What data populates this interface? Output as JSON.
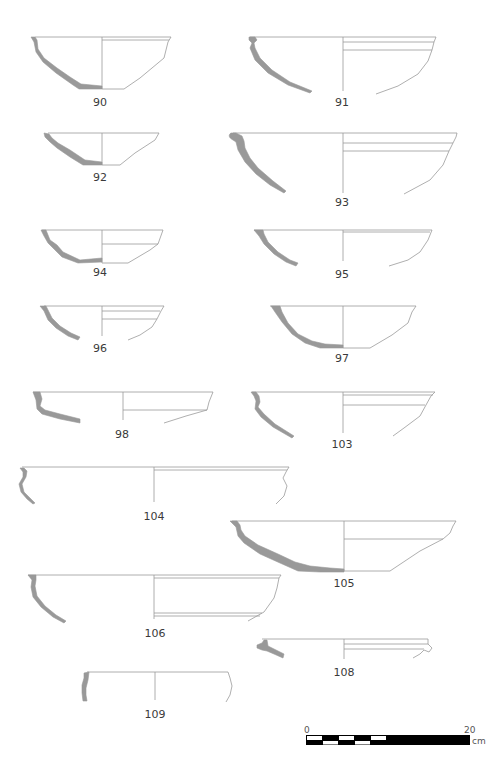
{
  "figure": {
    "type": "pottery profile drawing plate",
    "vessels": [
      {
        "id": "90",
        "label": "90"
      },
      {
        "id": "91",
        "label": "91"
      },
      {
        "id": "92",
        "label": "92"
      },
      {
        "id": "93",
        "label": "93"
      },
      {
        "id": "94",
        "label": "94"
      },
      {
        "id": "95",
        "label": "95"
      },
      {
        "id": "96",
        "label": "96"
      },
      {
        "id": "97",
        "label": "97"
      },
      {
        "id": "98",
        "label": "98"
      },
      {
        "id": "103",
        "label": "103"
      },
      {
        "id": "104",
        "label": "104"
      },
      {
        "id": "105",
        "label": "105"
      },
      {
        "id": "106",
        "label": "106"
      },
      {
        "id": "108",
        "label": "108"
      },
      {
        "id": "109",
        "label": "109"
      }
    ],
    "scale_bar": {
      "start_label": "0",
      "end_label": "20",
      "unit": "cm",
      "segments": 10
    },
    "colors": {
      "section_fill": "#999999",
      "outline": "#9a9a9a",
      "label_text": "#3a3a3a"
    }
  }
}
